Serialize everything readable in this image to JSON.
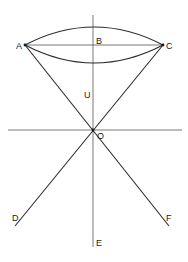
{
  "diagram": {
    "labels": {
      "A": "A",
      "B": "B",
      "C": "C",
      "U": "U",
      "O": "O",
      "D": "D",
      "E": "E",
      "F": "F"
    },
    "colors": {
      "line": "#2a2a2a",
      "background": "#ffffff"
    }
  }
}
